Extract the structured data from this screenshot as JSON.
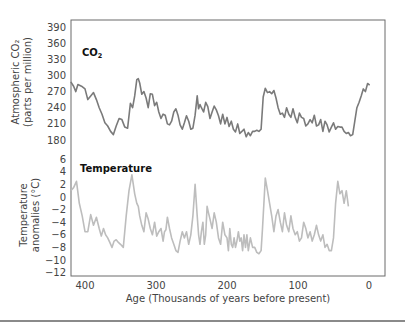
{
  "chart_data": {
    "type": "line",
    "title": "",
    "xlabel": "Age (Thousands of years before present)",
    "x_ticks": [
      400,
      300,
      200,
      100,
      0
    ],
    "x_range": [
      420,
      -22
    ],
    "grid": false,
    "panels": [
      {
        "name": "CO2",
        "label": "CO",
        "label_sub": "2",
        "ylabel_line1": "Atmospheric CO₂",
        "ylabel_line2": "(parts per million)",
        "y_ticks": [
          390,
          360,
          330,
          300,
          270,
          240,
          210,
          180
        ],
        "ylim": [
          180,
          390
        ],
        "color": "#7a7a7a",
        "series": {
          "x": [
            420,
            416,
            413,
            410,
            405,
            400,
            396,
            392,
            388,
            384,
            380,
            376,
            372,
            368,
            364,
            360,
            356,
            352,
            348,
            344,
            340,
            336,
            333,
            330,
            327,
            325,
            323,
            320,
            317,
            314,
            311,
            308,
            305,
            302,
            299,
            296,
            293,
            290,
            287,
            284,
            281,
            278,
            275,
            272,
            269,
            266,
            263,
            260,
            257,
            254,
            251,
            248,
            245,
            242,
            240,
            238,
            236,
            233,
            230,
            227,
            224,
            221,
            218,
            215,
            212,
            209,
            206,
            203,
            200,
            197,
            194,
            191,
            188,
            185,
            182,
            179,
            176,
            173,
            170,
            167,
            164,
            161,
            158,
            155,
            152,
            149,
            146,
            143,
            140,
            137,
            134,
            131,
            128,
            125,
            122,
            119,
            116,
            113,
            110,
            107,
            104,
            101,
            98,
            95,
            92,
            89,
            86,
            83,
            80,
            77,
            74,
            71,
            68,
            65,
            62,
            59,
            56,
            53,
            50,
            47,
            44,
            41,
            38,
            35,
            32,
            29,
            26,
            23,
            20,
            17,
            14,
            11,
            8,
            5,
            2,
            -1,
            -4,
            -6
          ],
          "values": [
            288,
            280,
            270,
            283,
            280,
            275,
            255,
            262,
            268,
            255,
            240,
            228,
            212,
            206,
            196,
            190,
            206,
            220,
            218,
            204,
            202,
            248,
            240,
            262,
            292,
            294,
            286,
            265,
            270,
            258,
            240,
            266,
            265,
            244,
            250,
            232,
            220,
            228,
            226,
            210,
            208,
            215,
            232,
            238,
            226,
            208,
            200,
            212,
            225,
            215,
            200,
            202,
            226,
            262,
            238,
            246,
            240,
            232,
            250,
            242,
            220,
            232,
            243,
            236,
            225,
            210,
            228,
            210,
            222,
            205,
            215,
            200,
            195,
            210,
            192,
            196,
            200,
            186,
            194,
            188,
            196,
            196,
            198,
            196,
            200,
            260,
            276,
            268,
            270,
            266,
            272,
            258,
            240,
            228,
            230,
            222,
            240,
            228,
            222,
            238,
            222,
            212,
            230,
            222,
            220,
            206,
            210,
            218,
            212,
            226,
            206,
            208,
            218,
            196,
            215,
            208,
            195,
            204,
            212,
            200,
            205,
            204,
            204,
            196,
            192,
            194,
            188,
            190,
            215,
            240,
            250,
            262,
            275,
            270,
            285,
            282
          ]
        }
      },
      {
        "name": "Temperature",
        "label": "Temperature",
        "ylabel_line1": "Temperature",
        "ylabel_line2": "anomalies (°C)",
        "y_ticks": [
          6,
          4,
          2,
          0,
          -2,
          -4,
          -6,
          -8,
          -10,
          -12
        ],
        "ylim": [
          -12,
          6
        ],
        "color": "#bdbdbd",
        "series": {
          "x": [
            420,
            416,
            412,
            408,
            404,
            400,
            396,
            392,
            388,
            384,
            380,
            377,
            374,
            371,
            368,
            365,
            362,
            359,
            356,
            353,
            350,
            346,
            342,
            338,
            334,
            330,
            327,
            325,
            323,
            320,
            317,
            314,
            311,
            308,
            305,
            302,
            299,
            296,
            293,
            290,
            288,
            286,
            284,
            281,
            278,
            275,
            272,
            269,
            266,
            263,
            260,
            257,
            254,
            251,
            248,
            245,
            242,
            240,
            238,
            236,
            234,
            232,
            230,
            228,
            226,
            224,
            221,
            218,
            215,
            212,
            209,
            206,
            203,
            200,
            198,
            196,
            194,
            192,
            190,
            188,
            186,
            184,
            182,
            180,
            178,
            176,
            174,
            172,
            170,
            167,
            164,
            161,
            158,
            155,
            152,
            150,
            148,
            146,
            143,
            140,
            137,
            134,
            131,
            128,
            125,
            122,
            119,
            116,
            113,
            110,
            107,
            104,
            101,
            98,
            95,
            92,
            89,
            86,
            83,
            80,
            77,
            74,
            71,
            68,
            65,
            62,
            59,
            56,
            53,
            50,
            47,
            44,
            41,
            38,
            35,
            32,
            29,
            26,
            23,
            20,
            17,
            14,
            11,
            8,
            5,
            2,
            0,
            -2,
            -4,
            -6
          ],
          "values": [
            1,
            1.5,
            2.5,
            -1,
            -3,
            -5.5,
            -5.5,
            -2.8,
            -4.5,
            -3.2,
            -5,
            -6.2,
            -5,
            -6,
            -6.5,
            -7.2,
            -8,
            -7,
            -6.8,
            -7.2,
            -7.5,
            -8,
            -3,
            1,
            3.5,
            0.5,
            -1,
            -1.5,
            -3,
            -4.5,
            -5.5,
            -2.5,
            -3.5,
            -5,
            -6,
            -4,
            -6.2,
            -5.5,
            -5,
            -7,
            -5.5,
            -5.2,
            -3.2,
            -5,
            -6.5,
            -7.5,
            -8.5,
            -8.8,
            -7,
            -5.5,
            -6.5,
            -5.5,
            -7.5,
            -6,
            -3,
            2,
            -3,
            -6,
            -7.5,
            -5.5,
            -4,
            -7.5,
            -6,
            -1.5,
            -2.5,
            -3.5,
            -5,
            -2.5,
            -4,
            -6.5,
            -7.5,
            -4,
            -6,
            -6.5,
            -8.5,
            -5,
            -7.5,
            -8,
            -6.5,
            -8,
            -7,
            -5.5,
            -7,
            -6.5,
            -8.5,
            -6,
            -8,
            -6,
            -8.5,
            -6.5,
            -8,
            -8,
            -8.8,
            -9,
            -8.5,
            -5,
            -1,
            3,
            1,
            -1,
            -3,
            -5.5,
            -3,
            -2,
            -4,
            -5.5,
            -2.5,
            -4.5,
            -5.5,
            -3,
            -5,
            -6,
            -5.5,
            -7,
            -6.5,
            -4,
            -5,
            -6.5,
            -5.5,
            -7,
            -6,
            -4.5,
            -6,
            -7,
            -6,
            -8,
            -7.5,
            -8.5,
            -8.5,
            -6.5,
            -1,
            2.5,
            0.5,
            1,
            -1,
            1,
            -1.5
          ]
        }
      }
    ]
  }
}
